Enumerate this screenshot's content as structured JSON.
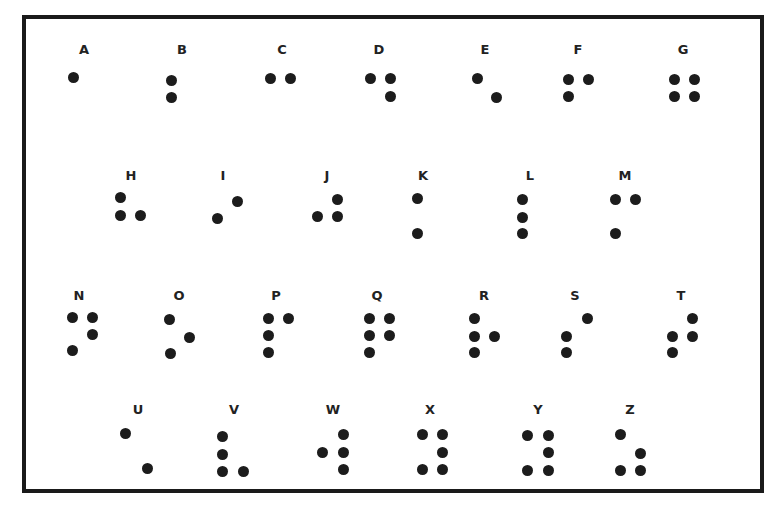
{
  "chart": {
    "frame_color": "#1a1a1a",
    "dot_color": "#1c1c1c",
    "letters": [
      {
        "letter": "A",
        "label": [
          84,
          50
        ],
        "dots": [
          [
            73,
            77
          ]
        ]
      },
      {
        "letter": "B",
        "label": [
          182,
          50
        ],
        "dots": [
          [
            171,
            80
          ],
          [
            171,
            97
          ]
        ]
      },
      {
        "letter": "C",
        "label": [
          282,
          50
        ],
        "dots": [
          [
            270,
            78
          ],
          [
            290,
            78
          ]
        ]
      },
      {
        "letter": "D",
        "label": [
          379,
          50
        ],
        "dots": [
          [
            370,
            78
          ],
          [
            390,
            78
          ],
          [
            390,
            96
          ]
        ]
      },
      {
        "letter": "E",
        "label": [
          485,
          50
        ],
        "dots": [
          [
            477,
            78
          ],
          [
            496,
            97
          ]
        ]
      },
      {
        "letter": "F",
        "label": [
          578,
          50
        ],
        "dots": [
          [
            568,
            79
          ],
          [
            588,
            79
          ],
          [
            568,
            96
          ]
        ]
      },
      {
        "letter": "G",
        "label": [
          683,
          50
        ],
        "dots": [
          [
            674,
            79
          ],
          [
            694,
            79
          ],
          [
            674,
            96
          ],
          [
            694,
            96
          ]
        ]
      },
      {
        "letter": "H",
        "label": [
          131,
          176
        ],
        "dots": [
          [
            120,
            197
          ],
          [
            120,
            215
          ],
          [
            140,
            215
          ]
        ]
      },
      {
        "letter": "I",
        "label": [
          223,
          176
        ],
        "dots": [
          [
            237,
            201
          ],
          [
            217,
            218
          ]
        ]
      },
      {
        "letter": "J",
        "label": [
          327,
          176
        ],
        "dots": [
          [
            337,
            199
          ],
          [
            317,
            216
          ],
          [
            337,
            216
          ]
        ]
      },
      {
        "letter": "K",
        "label": [
          423,
          176
        ],
        "dots": [
          [
            417,
            198
          ],
          [
            417,
            233
          ]
        ]
      },
      {
        "letter": "L",
        "label": [
          530,
          176
        ],
        "dots": [
          [
            522,
            199
          ],
          [
            522,
            217
          ],
          [
            522,
            233
          ]
        ]
      },
      {
        "letter": "M",
        "label": [
          625,
          176
        ],
        "dots": [
          [
            615,
            199
          ],
          [
            635,
            199
          ],
          [
            615,
            233
          ]
        ]
      },
      {
        "letter": "N",
        "label": [
          79,
          296
        ],
        "dots": [
          [
            72,
            317
          ],
          [
            92,
            317
          ],
          [
            92,
            334
          ],
          [
            72,
            350
          ]
        ]
      },
      {
        "letter": "O",
        "label": [
          179,
          296
        ],
        "dots": [
          [
            169,
            319
          ],
          [
            189,
            337
          ],
          [
            170,
            353
          ]
        ]
      },
      {
        "letter": "P",
        "label": [
          276,
          296
        ],
        "dots": [
          [
            268,
            318
          ],
          [
            288,
            318
          ],
          [
            268,
            335
          ],
          [
            268,
            352
          ]
        ]
      },
      {
        "letter": "Q",
        "label": [
          377,
          296
        ],
        "dots": [
          [
            369,
            318
          ],
          [
            389,
            318
          ],
          [
            369,
            335
          ],
          [
            389,
            335
          ],
          [
            369,
            352
          ]
        ]
      },
      {
        "letter": "R",
        "label": [
          484,
          296
        ],
        "dots": [
          [
            474,
            318
          ],
          [
            474,
            336
          ],
          [
            494,
            336
          ],
          [
            474,
            352
          ]
        ]
      },
      {
        "letter": "S",
        "label": [
          575,
          296
        ],
        "dots": [
          [
            587,
            318
          ],
          [
            566,
            336
          ],
          [
            566,
            352
          ]
        ]
      },
      {
        "letter": "T",
        "label": [
          681,
          296
        ],
        "dots": [
          [
            692,
            318
          ],
          [
            672,
            336
          ],
          [
            692,
            336
          ],
          [
            672,
            352
          ]
        ]
      },
      {
        "letter": "U",
        "label": [
          138,
          410
        ],
        "dots": [
          [
            125,
            433
          ],
          [
            147,
            468
          ]
        ]
      },
      {
        "letter": "V",
        "label": [
          234,
          410
        ],
        "dots": [
          [
            222,
            436
          ],
          [
            222,
            454
          ],
          [
            222,
            471
          ],
          [
            243,
            471
          ]
        ]
      },
      {
        "letter": "W",
        "label": [
          333,
          410
        ],
        "dots": [
          [
            343,
            434
          ],
          [
            322,
            452
          ],
          [
            343,
            452
          ],
          [
            343,
            469
          ]
        ]
      },
      {
        "letter": "X",
        "label": [
          430,
          410
        ],
        "dots": [
          [
            422,
            434
          ],
          [
            442,
            434
          ],
          [
            442,
            452
          ],
          [
            422,
            469
          ],
          [
            442,
            469
          ]
        ]
      },
      {
        "letter": "Y",
        "label": [
          538,
          410
        ],
        "dots": [
          [
            527,
            435
          ],
          [
            548,
            435
          ],
          [
            548,
            452
          ],
          [
            527,
            470
          ],
          [
            548,
            470
          ]
        ]
      },
      {
        "letter": "Z",
        "label": [
          630,
          410
        ],
        "dots": [
          [
            620,
            434
          ],
          [
            640,
            453
          ],
          [
            620,
            470
          ],
          [
            640,
            470
          ]
        ]
      }
    ]
  }
}
